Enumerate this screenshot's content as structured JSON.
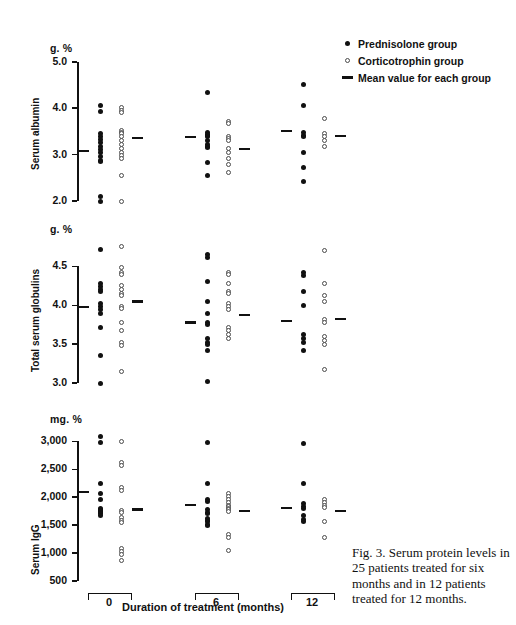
{
  "figure": {
    "caption": "Fig. 3. Serum protein levels in 25 patients treated for six months and in 12 patients treated for 12 months.",
    "xaxis_title": "Duration of treatment (months)",
    "group_labels": [
      "0",
      "6",
      "12"
    ]
  },
  "legend": {
    "items": [
      {
        "symbol": "filled-circle",
        "label": "Prednisolone group"
      },
      {
        "symbol": "open-circle",
        "label": "Corticotrophin group"
      },
      {
        "symbol": "dash",
        "label": "Mean value for each group"
      }
    ]
  },
  "chart_data": [
    {
      "type": "scatter",
      "title": "Serum albumin",
      "ylabel": "Serum albumin",
      "unit": "g. %",
      "xlabel": "Duration of treatment (months)",
      "ylim": [
        1.8,
        5.0
      ],
      "yticks": [
        5.0,
        4.0,
        3.0,
        2.0
      ],
      "ytick_labels": [
        "5.0",
        "4.0",
        "3.0",
        "2.0"
      ],
      "grid": false,
      "categories": [
        "0",
        "6",
        "12"
      ],
      "series": [
        {
          "name": "Prednisolone group",
          "symbol": "filled-circle",
          "groups": [
            {
              "category": "0",
              "values": [
                4.05,
                3.92,
                3.45,
                3.4,
                3.32,
                3.25,
                3.18,
                3.1,
                3.05,
                2.95,
                2.88,
                2.85,
                2.1,
                1.98
              ],
              "mean": 3.08
            },
            {
              "category": "6",
              "values": [
                4.33,
                3.47,
                3.44,
                3.42,
                3.38,
                3.3,
                3.22,
                3.18,
                3.15,
                2.82,
                2.55
              ],
              "mean": 3.38
            },
            {
              "category": "12",
              "values": [
                4.52,
                4.05,
                3.48,
                3.42,
                3.38,
                3.05,
                2.72,
                2.42
              ],
              "mean": 3.5
            }
          ]
        },
        {
          "name": "Corticotrophin group",
          "symbol": "open-circle",
          "groups": [
            {
              "category": "0",
              "values": [
                4.02,
                3.95,
                3.9,
                3.52,
                3.48,
                3.45,
                3.38,
                3.3,
                3.22,
                3.12,
                3.05,
                2.98,
                2.92,
                2.55,
                1.98
              ],
              "mean": 3.35
            },
            {
              "category": "6",
              "values": [
                3.72,
                3.68,
                3.4,
                3.35,
                3.3,
                3.12,
                3.05,
                2.92,
                2.78,
                2.62
              ],
              "mean": 3.12
            },
            {
              "category": "12",
              "values": [
                3.78,
                3.45,
                3.38,
                3.3,
                3.18
              ],
              "mean": 3.4
            }
          ]
        }
      ]
    },
    {
      "type": "scatter",
      "title": "Total serum globulins",
      "ylabel": "Total serum globulins",
      "unit": "g. %",
      "xlabel": "Duration of treatment (months)",
      "ylim": [
        2.9,
        4.8
      ],
      "yticks": [
        4.5,
        4.0,
        3.5,
        3.0
      ],
      "ytick_labels": [
        "4.5",
        "4.0",
        "3.5",
        "3.0"
      ],
      "grid": false,
      "categories": [
        "0",
        "6",
        "12"
      ],
      "series": [
        {
          "name": "Prednisolone group",
          "symbol": "filled-circle",
          "groups": [
            {
              "category": "0",
              "values": [
                4.72,
                4.28,
                4.24,
                4.2,
                4.18,
                4.02,
                3.98,
                3.95,
                3.9,
                3.72,
                3.35,
                3.0
              ],
              "mean": 3.98
            },
            {
              "category": "6",
              "values": [
                4.65,
                4.62,
                4.3,
                4.05,
                3.9,
                3.78,
                3.75,
                3.58,
                3.52,
                3.5,
                3.42,
                3.02
              ],
              "mean": 3.78
            },
            {
              "category": "12",
              "values": [
                4.42,
                4.38,
                4.18,
                4.0,
                3.62,
                3.58,
                3.52,
                3.42
              ],
              "mean": 3.8
            }
          ]
        },
        {
          "name": "Corticotrophin group",
          "symbol": "open-circle",
          "groups": [
            {
              "category": "0",
              "values": [
                4.75,
                4.48,
                4.42,
                4.4,
                4.25,
                4.2,
                4.15,
                4.12,
                3.98,
                3.96,
                3.78,
                3.68,
                3.52,
                3.48,
                3.15
              ],
              "mean": 4.05
            },
            {
              "category": "6",
              "values": [
                4.42,
                4.4,
                4.28,
                4.18,
                4.15,
                4.02,
                3.98,
                3.95,
                3.72,
                3.68,
                3.62,
                3.58
              ],
              "mean": 3.88
            },
            {
              "category": "12",
              "values": [
                4.7,
                4.28,
                4.12,
                4.05,
                3.82,
                3.78,
                3.6,
                3.55,
                3.5,
                3.18
              ],
              "mean": 3.82
            }
          ]
        }
      ]
    },
    {
      "type": "scatter",
      "title": "Serum IgG",
      "ylabel": "Serum IgG",
      "unit": "mg. %",
      "xlabel": "Duration of treatment (months)",
      "ylim": [
        500,
        3150
      ],
      "yticks": [
        3000,
        2500,
        2000,
        1500,
        1000,
        500
      ],
      "ytick_labels": [
        "3,000",
        "2,500",
        "2,000",
        "1,500",
        "1,000",
        "500"
      ],
      "grid": false,
      "categories": [
        "0",
        "6",
        "12"
      ],
      "series": [
        {
          "name": "Prednisolone group",
          "symbol": "filled-circle",
          "groups": [
            {
              "category": "0",
              "values": [
                3080,
                2980,
                2250,
                2060,
                1960,
                1800,
                1780,
                1760,
                1740,
                1720,
                1700,
                1680
              ],
              "mean": 2100
            },
            {
              "category": "6",
              "values": [
                2980,
                2250,
                1960,
                1930,
                1780,
                1720,
                1700,
                1620,
                1580,
                1560,
                1520,
                1500
              ],
              "mean": 1860
            },
            {
              "category": "12",
              "values": [
                2960,
                2250,
                1880,
                1840,
                1800,
                1680,
                1600,
                1560
              ],
              "mean": 1800
            }
          ]
        },
        {
          "name": "Corticotrophin group",
          "symbol": "open-circle",
          "groups": [
            {
              "category": "0",
              "values": [
                3000,
                2620,
                2560,
                2180,
                2120,
                1760,
                1720,
                1640,
                1580,
                1540,
                1080,
                1020,
                980,
                860
              ],
              "mean": 1780
            },
            {
              "category": "6",
              "values": [
                2060,
                2020,
                1960,
                1900,
                1860,
                1840,
                1800,
                1780,
                1740,
                1340,
                1280,
                1040
              ],
              "mean": 1760
            },
            {
              "category": "12",
              "values": [
                1960,
                1900,
                1860,
                1820,
                1560,
                1280
              ],
              "mean": 1760
            }
          ]
        }
      ]
    }
  ]
}
